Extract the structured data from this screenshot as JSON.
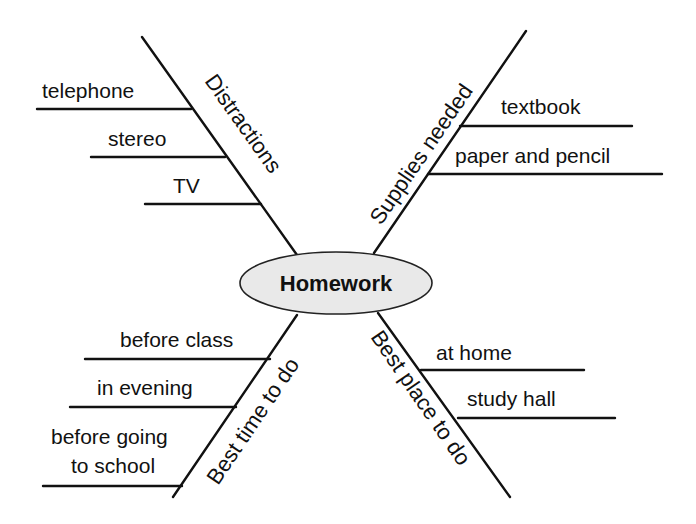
{
  "center": {
    "label": "Homework",
    "fill": "#e9e9e9",
    "stroke": "#222222"
  },
  "branches": [
    {
      "id": "distractions",
      "label": "Distractions",
      "position": "upper-left",
      "details": [
        "telephone",
        "stereo",
        "TV"
      ]
    },
    {
      "id": "supplies-needed",
      "label": "Supplies needed",
      "position": "upper-right",
      "details": [
        "textbook",
        "paper and pencil"
      ]
    },
    {
      "id": "best-time-to-do",
      "label": "Best time to do",
      "position": "lower-left",
      "details": [
        "before class",
        "in evening",
        "before going to school"
      ],
      "detail_lines": {
        "before_going": "before going",
        "to_school": "to school"
      }
    },
    {
      "id": "best-place-to-do",
      "label": "Best place to do",
      "position": "lower-right",
      "details": [
        "at home",
        "study hall"
      ]
    }
  ],
  "colors": {
    "ink": "#111111",
    "ellipse_fill": "#e9e9e9",
    "background": "#ffffff"
  }
}
